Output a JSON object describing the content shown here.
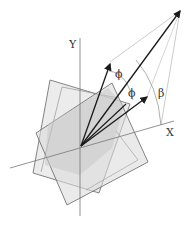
{
  "diagram": {
    "type": "geometric vector rotation diagram",
    "labels": {
      "y_axis": "Y",
      "x_axis": "X",
      "phi_upper": "ϕ",
      "phi_lower": "ϕ",
      "beta": "β"
    },
    "colors": {
      "background": "#ffffff",
      "square_fill_light": "#e6e6e6",
      "square_fill_mid": "#d6d6d6",
      "overlap_fill": "#c8c8c8",
      "edge": "#555555",
      "axis": "#777777",
      "vector": "#1a1a1a",
      "thin_guide": "#999999"
    },
    "elements": [
      "coordinate axes X and Y",
      "two overlapping rotated translucent squares",
      "three vectors from origin separated by angle phi",
      "angle beta measured from X axis",
      "guide lines connecting vector tips"
    ]
  }
}
